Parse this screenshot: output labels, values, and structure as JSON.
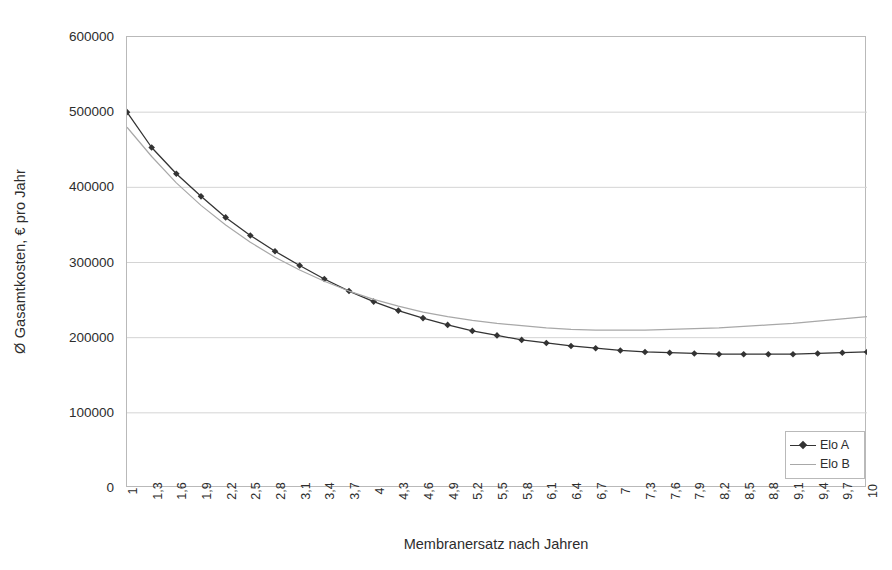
{
  "chart_data": {
    "type": "line",
    "title": "",
    "xlabel": "Membranersatz nach Jahren",
    "ylabel": "Ø Gasamtkosten, € pro Jahr",
    "grid": true,
    "legend_position": "bottom-right-inside",
    "ylim": [
      0,
      600000
    ],
    "ytick_labels": [
      "600000",
      "500000",
      "400000",
      "300000",
      "200000",
      "100000",
      "0"
    ],
    "ytick_values": [
      600000,
      500000,
      400000,
      300000,
      200000,
      100000,
      0
    ],
    "categories": [
      "1",
      "1,3",
      "1,6",
      "1,9",
      "2,2",
      "2,5",
      "2,8",
      "3,1",
      "3,4",
      "3,7",
      "4",
      "4,3",
      "4,6",
      "4,9",
      "5,2",
      "5,5",
      "5,8",
      "6,1",
      "6,4",
      "6,7",
      "7",
      "7,3",
      "7,6",
      "7,9",
      "8,2",
      "8,5",
      "8,8",
      "9,1",
      "9,4",
      "9,7",
      "10"
    ],
    "x": [
      1,
      1.3,
      1.6,
      1.9,
      2.2,
      2.5,
      2.8,
      3.1,
      3.4,
      3.7,
      4,
      4.3,
      4.6,
      4.9,
      5.2,
      5.5,
      5.8,
      6.1,
      6.4,
      6.7,
      7,
      7.3,
      7.6,
      7.9,
      8.2,
      8.5,
      8.8,
      9.1,
      9.4,
      9.7,
      10
    ],
    "series": [
      {
        "name": "Elo A",
        "color": "#333333",
        "marker": "diamond",
        "values": [
          500000,
          455000,
          418000,
          389000,
          362000,
          340000,
          321000,
          305000,
          291000,
          280000,
          271000,
          262000,
          255000,
          249000,
          244000,
          240000,
          237000,
          234000,
          232000,
          230000,
          229000,
          228000,
          228000,
          227000,
          227000,
          228000,
          228000,
          229000,
          230000,
          232000,
          234000
        ]
      },
      {
        "name": "Elo B",
        "color": "#a8a8a8",
        "marker": "none",
        "values": [
          480000,
          441000,
          407000,
          379000,
          355000,
          335000,
          318000,
          303000,
          291000,
          281000,
          273000,
          266000,
          260000,
          256000,
          253000,
          251000,
          250000,
          249000,
          250000,
          251000,
          253000,
          255000,
          257000,
          259000,
          262000,
          264000,
          267000,
          270000,
          273000,
          276000,
          279000
        ]
      }
    ],
    "plotted_series": [
      {
        "name": "Elo A",
        "color": "#333333",
        "marker": "diamond",
        "values": [
          500000,
          453000,
          418000,
          389000,
          361000,
          339000,
          319000,
          300000,
          283000,
          268000,
          257000,
          246000,
          237000,
          229000,
          221000,
          214000,
          209000,
          204000,
          199000,
          196000,
          193000,
          190000,
          188000,
          186000,
          184000,
          183000,
          182000,
          181000,
          181000,
          180000,
          179000
        ]
      },
      {
        "name": "Elo B",
        "color": "#a8a8a8",
        "marker": "none",
        "values": [
          480000,
          440000,
          405000,
          377000,
          352000,
          330000,
          312000,
          296000,
          282000,
          269000,
          258000,
          249000,
          241000,
          234000,
          228000,
          223000,
          219000,
          215000,
          212000,
          209000,
          207000,
          205000,
          204000,
          203000,
          202000,
          202000,
          202000,
          203000,
          204000,
          205000,
          207000
        ]
      }
    ],
    "series_pixel_fit": {
      "note": "values below are the on-screen readings used to draw the curves",
      "Elo A": [
        500000,
        453000,
        418000,
        388000,
        360000,
        336000,
        315000,
        296000,
        278000,
        262000,
        248000,
        236000,
        226000,
        217000,
        209000,
        203000,
        197000,
        193000,
        189000,
        186000,
        183000,
        181000,
        180000,
        179000,
        178000,
        178000,
        178000,
        178000,
        179000,
        180000,
        181000
      ],
      "Elo B": [
        480000,
        441000,
        406000,
        376000,
        350000,
        327000,
        307000,
        290000,
        275000,
        262000,
        251000,
        242000,
        234000,
        228000,
        223000,
        219000,
        216000,
        213000,
        211000,
        210000,
        210000,
        210000,
        211000,
        212000,
        213000,
        215000,
        217000,
        219000,
        222000,
        225000,
        228000
      ]
    }
  },
  "legend": {
    "entries": [
      {
        "label": "Elo A"
      },
      {
        "label": "Elo B"
      }
    ]
  }
}
